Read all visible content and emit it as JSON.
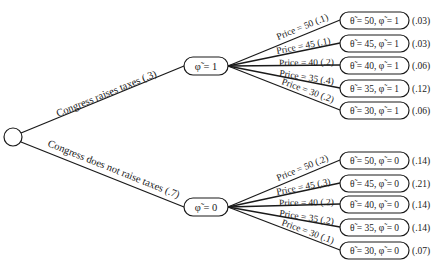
{
  "diagram": {
    "type": "decision-tree",
    "root": {
      "shape": "circle",
      "label": ""
    },
    "branches": [
      {
        "edge_label": "Congress raises taxes (.3)",
        "node_label": "φ̃ = 1",
        "children": [
          {
            "edge_label": "Price = 50 (.1)",
            "leaf_label": "θ̃ = 50, φ̃ = 1",
            "probability": "(.03)"
          },
          {
            "edge_label": "Price = 45 (.1)",
            "leaf_label": "θ̃ = 45, φ̃ = 1",
            "probability": "(.03)"
          },
          {
            "edge_label": "Price = 40 (.2)",
            "leaf_label": "θ̃ = 40, φ̃ = 1",
            "probability": "(.06)"
          },
          {
            "edge_label": "Price = 35 (.4)",
            "leaf_label": "θ̃ = 35, φ̃ = 1",
            "probability": "(.12)"
          },
          {
            "edge_label": "Price = 30 (.2)",
            "leaf_label": "θ̃ = 30, φ̃ = 1",
            "probability": "(.06)"
          }
        ]
      },
      {
        "edge_label": "Congress does not raise taxes (.7)",
        "node_label": "φ̃ = 0",
        "children": [
          {
            "edge_label": "Price = 50 (.2)",
            "leaf_label": "θ̃ = 50, φ̃ = 0",
            "probability": "(.14)"
          },
          {
            "edge_label": "Price = 45 (.3)",
            "leaf_label": "θ̃ = 45, φ̃ = 0",
            "probability": "(.21)"
          },
          {
            "edge_label": "Price = 40 (.2)",
            "leaf_label": "θ̃ = 40, φ̃ = 0",
            "probability": "(.14)"
          },
          {
            "edge_label": "Price = 35 (.2)",
            "leaf_label": "θ̃ = 35, φ̃ = 0",
            "probability": "(.14)"
          },
          {
            "edge_label": "Price = 30 (.1)",
            "leaf_label": "θ̃ = 30, φ̃ = 0",
            "probability": "(.07)"
          }
        ]
      }
    ]
  }
}
